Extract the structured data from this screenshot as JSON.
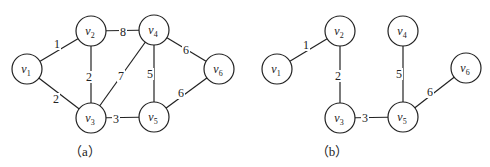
{
  "figures": [
    {
      "id": "a",
      "caption": "（a）",
      "caption_pos": [
        85,
        156
      ],
      "nodes": [
        {
          "id": "v1",
          "base": "v",
          "sub": "1",
          "x": 27,
          "y": 69
        },
        {
          "id": "v2",
          "base": "v",
          "sub": "2",
          "x": 91,
          "y": 31
        },
        {
          "id": "v4",
          "base": "v",
          "sub": "4",
          "x": 154,
          "y": 30
        },
        {
          "id": "v6",
          "base": "v",
          "sub": "6",
          "x": 219,
          "y": 69
        },
        {
          "id": "v3",
          "base": "v",
          "sub": "3",
          "x": 91,
          "y": 118
        },
        {
          "id": "v5",
          "base": "v",
          "sub": "5",
          "x": 154,
          "y": 117
        }
      ],
      "edges": [
        {
          "from": "v1",
          "to": "v2",
          "weight": "1",
          "lx": 57,
          "ly": 44
        },
        {
          "from": "v1",
          "to": "v3",
          "weight": "2",
          "lx": 56,
          "ly": 99
        },
        {
          "from": "v2",
          "to": "v4",
          "weight": "8",
          "lx": 123,
          "ly": 32
        },
        {
          "from": "v2",
          "to": "v3",
          "weight": "2",
          "lx": 89,
          "ly": 77
        },
        {
          "from": "v3",
          "to": "v4",
          "weight": "7",
          "lx": 121,
          "ly": 76
        },
        {
          "from": "v4",
          "to": "v5",
          "weight": "5",
          "lx": 150,
          "ly": 74
        },
        {
          "from": "v4",
          "to": "v6",
          "weight": "6",
          "lx": 186,
          "ly": 50
        },
        {
          "from": "v5",
          "to": "v6",
          "weight": "6",
          "lx": 181,
          "ly": 93
        },
        {
          "from": "v3",
          "to": "v5",
          "weight": "3",
          "lx": 116,
          "ly": 119
        }
      ]
    },
    {
      "id": "b",
      "caption": "（b）",
      "caption_pos": [
        332,
        156
      ],
      "nodes": [
        {
          "id": "v1",
          "base": "v",
          "sub": "1",
          "x": 277,
          "y": 69
        },
        {
          "id": "v2",
          "base": "v",
          "sub": "2",
          "x": 340,
          "y": 31
        },
        {
          "id": "v4",
          "base": "v",
          "sub": "4",
          "x": 403,
          "y": 31
        },
        {
          "id": "v6",
          "base": "v",
          "sub": "6",
          "x": 466,
          "y": 68
        },
        {
          "id": "v3",
          "base": "v",
          "sub": "3",
          "x": 340,
          "y": 118
        },
        {
          "id": "v5",
          "base": "v",
          "sub": "5",
          "x": 403,
          "y": 117
        }
      ],
      "edges": [
        {
          "from": "v1",
          "to": "v2",
          "weight": "1",
          "lx": 306,
          "ly": 45
        },
        {
          "from": "v2",
          "to": "v3",
          "weight": "2",
          "lx": 338,
          "ly": 76
        },
        {
          "from": "v4",
          "to": "v5",
          "weight": "5",
          "lx": 399,
          "ly": 74
        },
        {
          "from": "v5",
          "to": "v6",
          "weight": "6",
          "lx": 430,
          "ly": 92
        },
        {
          "from": "v3",
          "to": "v5",
          "weight": "3",
          "lx": 365,
          "ly": 118
        }
      ]
    }
  ],
  "node_radius": 15
}
